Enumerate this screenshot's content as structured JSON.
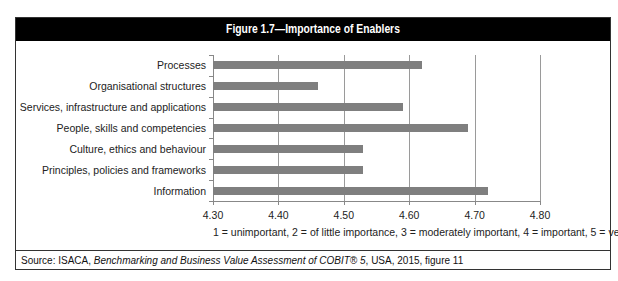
{
  "figure": {
    "title": "Figure 1.7—Importance of Enablers",
    "note": "1 = unimportant, 2 = of little importance, 3 = moderately important, 4 = important, 5 = very important",
    "source_prefix": "Source:  ISACA, ",
    "source_italic": "Benchmarking and Business Value Assessment of COBIT® 5",
    "source_suffix": ", USA, 2015, figure 11"
  },
  "chart_data": {
    "type": "bar",
    "orientation": "horizontal",
    "title": "Figure 1.7—Importance of Enablers",
    "categories": [
      "Processes",
      "Organisational structures",
      "Services, infrastructure and applications",
      "People, skills and competencies",
      "Culture, ethics and behaviour",
      "Principles, policies and frameworks",
      "Information"
    ],
    "values": [
      4.62,
      4.46,
      4.59,
      4.69,
      4.53,
      4.53,
      4.72
    ],
    "xlabel": "1 = unimportant, 2 = of little importance, 3 = moderately important, 4 = important, 5 = very important",
    "ylabel": "",
    "xlim": [
      4.3,
      4.8
    ],
    "xticks": [
      "4.30",
      "4.40",
      "4.50",
      "4.60",
      "4.70",
      "4.80"
    ],
    "grid": "vertical",
    "legend": "none",
    "bar_color": "#7f7f7f"
  }
}
